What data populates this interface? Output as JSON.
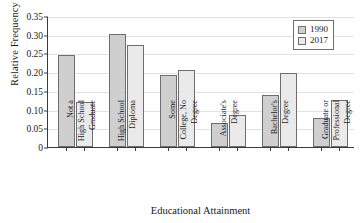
{
  "chart_data": {
    "type": "bar",
    "title": "",
    "xlabel": "Educational Attainment",
    "ylabel": "Relative Frequency",
    "categories": [
      "Not a High School Graduate",
      "High School Diploma",
      "Some College, No Degree",
      "Associate's Degree",
      "Bachelor's Degree",
      "Graduate or Professional Degree"
    ],
    "category_lines": [
      [
        "Not a",
        "High School",
        "Graduate"
      ],
      [
        "High School",
        "Diploma"
      ],
      [
        "Some",
        "College, No",
        "Degree"
      ],
      [
        "Associate's",
        "Degree"
      ],
      [
        "Bachelor's",
        "Degree"
      ],
      [
        "Graduate or",
        "Professional",
        "Degree"
      ]
    ],
    "series": [
      {
        "name": "1990",
        "color": "#cfcfcf",
        "values": [
          0.247,
          0.302,
          0.192,
          0.063,
          0.138,
          0.077
        ]
      },
      {
        "name": "2017",
        "color": "#eaeaea",
        "values": [
          0.121,
          0.273,
          0.206,
          0.086,
          0.199,
          0.126
        ]
      }
    ],
    "ylim": [
      0,
      0.35
    ],
    "yticks": [
      0,
      0.05,
      0.1,
      0.15,
      0.2,
      0.25,
      0.3,
      0.35
    ],
    "ytick_labels": [
      "0",
      "0.05",
      "0.10",
      "0.15",
      "0.20",
      "0.25",
      "0.30",
      "0.35"
    ],
    "grid": true,
    "legend_position": "top-right",
    "axis_color": "#3a3a3a",
    "grid_color": "#e2e2e2",
    "bar_border_color": "#6e6e6e"
  }
}
